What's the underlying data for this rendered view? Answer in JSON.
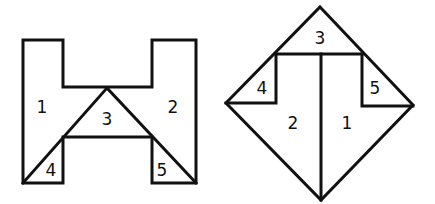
{
  "figure": {
    "stroke_color": "#111111",
    "background": "#ffffff"
  },
  "left_shape": {
    "name": "H-shape",
    "pieces": [
      {
        "id": "1",
        "label": "1"
      },
      {
        "id": "2",
        "label": "2"
      },
      {
        "id": "3",
        "label": "3"
      },
      {
        "id": "4",
        "label": "4"
      },
      {
        "id": "5",
        "label": "5"
      }
    ]
  },
  "right_shape": {
    "name": "Diamond",
    "pieces": [
      {
        "id": "1",
        "label": "1"
      },
      {
        "id": "2",
        "label": "2"
      },
      {
        "id": "3",
        "label": "3"
      },
      {
        "id": "4",
        "label": "4"
      },
      {
        "id": "5",
        "label": "5"
      }
    ]
  }
}
